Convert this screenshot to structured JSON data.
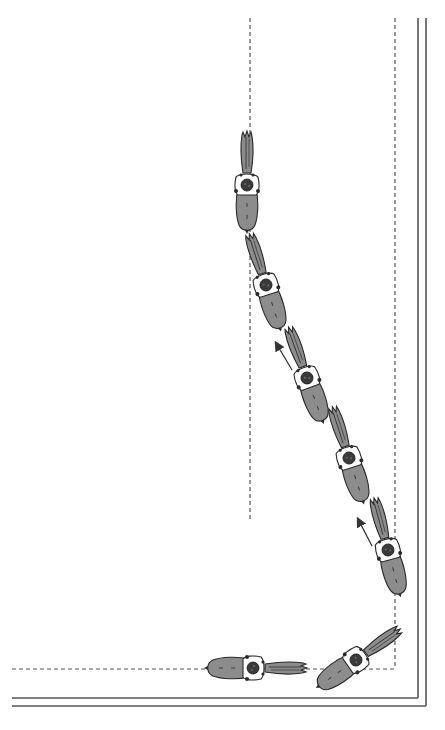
{
  "diagram": {
    "colors": {
      "background": "#ffffff",
      "line": "#555555",
      "horse_fill": "#8c8c8c",
      "horse_outline": "#2a2a2a",
      "rider_fill": "#ffffff",
      "helmet": "#3a3a3a"
    },
    "arena": {
      "outer_wall_lines": [
        {
          "x1": 12,
          "y1": 698,
          "x2": 418,
          "y2": 698
        },
        {
          "x1": 418,
          "y1": 18,
          "x2": 418,
          "y2": 698
        },
        {
          "x1": 12,
          "y1": 706,
          "x2": 426,
          "y2": 706
        },
        {
          "x1": 426,
          "y1": 18,
          "x2": 426,
          "y2": 706
        }
      ],
      "dashed_track_lines": [
        {
          "x1": 12,
          "y1": 669,
          "x2": 395,
          "y2": 669
        },
        {
          "x1": 395,
          "y1": 18,
          "x2": 395,
          "y2": 669
        },
        {
          "x1": 250,
          "y1": 18,
          "x2": 250,
          "y2": 520
        }
      ]
    },
    "horses": [
      {
        "label": "horse-1",
        "cx": 247,
        "cy": 185,
        "angle": 0
      },
      {
        "label": "horse-2",
        "cx": 266,
        "cy": 285,
        "angle": -18
      },
      {
        "label": "horse-3",
        "cx": 307,
        "cy": 378,
        "angle": -20
      },
      {
        "label": "horse-4",
        "cx": 349,
        "cy": 458,
        "angle": -18
      },
      {
        "label": "horse-5",
        "cx": 388,
        "cy": 550,
        "angle": -15
      },
      {
        "label": "horse-6",
        "cx": 356,
        "cy": 660,
        "angle": 55
      },
      {
        "label": "horse-7",
        "cx": 253,
        "cy": 668,
        "angle": 90
      }
    ],
    "arrows": [
      {
        "x1": 292,
        "y1": 370,
        "x2": 276,
        "y2": 343
      },
      {
        "x1": 372,
        "y1": 546,
        "x2": 358,
        "y2": 519
      }
    ]
  }
}
